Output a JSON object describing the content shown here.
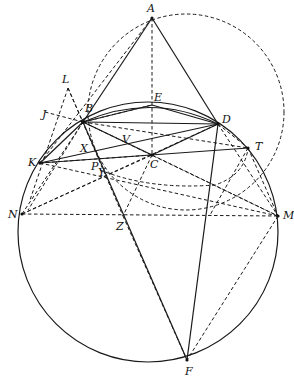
{
  "diagram": {
    "title": "",
    "points": {
      "A": {
        "label": "A",
        "x": 152,
        "y": 18
      },
      "B": {
        "label": "B",
        "x": 83,
        "y": 122
      },
      "E": {
        "label": "E",
        "x": 152,
        "y": 105
      },
      "D": {
        "label": "D",
        "x": 218,
        "y": 124
      },
      "T": {
        "label": "T",
        "x": 248,
        "y": 148
      },
      "C": {
        "label": "C",
        "x": 152,
        "y": 155
      },
      "K": {
        "label": "K",
        "x": 40,
        "y": 163
      },
      "N": {
        "label": "N",
        "x": 22,
        "y": 214
      },
      "M": {
        "label": "M",
        "x": 278,
        "y": 216
      },
      "Z": {
        "label": "Z",
        "x": 123,
        "y": 216
      },
      "F": {
        "label": "F",
        "x": 187,
        "y": 360
      },
      "X": {
        "label": "X",
        "x": 97,
        "y": 152
      },
      "Y": {
        "label": "Y",
        "x": 107,
        "y": 175
      },
      "P": {
        "label": "P",
        "x": 100,
        "y": 170
      },
      "V": {
        "label": "V",
        "x": 128,
        "y": 140
      },
      "L": {
        "label": "L",
        "x": 68,
        "y": 88
      },
      "J": {
        "label": "J",
        "x": 45,
        "y": 112
      }
    },
    "labels": {
      "A": "A",
      "B": "B",
      "E": "E",
      "D": "D",
      "T": "T",
      "C": "C",
      "K": "K",
      "N": "N",
      "M": "M",
      "Z": "Z",
      "F": "F",
      "X": "X",
      "Y": "Y",
      "P": "P",
      "V": "V",
      "L": "L",
      "J": "J"
    },
    "circles": [
      {
        "name": "circumcircle",
        "style": "solid",
        "cx": 148,
        "cy": 232,
        "r": 130
      },
      {
        "name": "dashed-circle",
        "style": "dashed",
        "cx": 186,
        "cy": 112,
        "r": 98
      }
    ],
    "solid_segments": [
      [
        "A",
        "B"
      ],
      [
        "A",
        "D"
      ],
      [
        "B",
        "D"
      ],
      [
        "B",
        "C"
      ],
      [
        "C",
        "D"
      ],
      [
        "K",
        "T"
      ],
      [
        "K",
        "D"
      ],
      [
        "B",
        "F"
      ],
      [
        "D",
        "F"
      ],
      [
        "K",
        "B"
      ]
    ],
    "dashed_segments": [
      [
        "A",
        "E"
      ],
      [
        "E",
        "C"
      ],
      [
        "A",
        "K"
      ],
      [
        "B",
        "T"
      ],
      [
        "N",
        "M"
      ],
      [
        "N",
        "D"
      ],
      [
        "K",
        "M"
      ],
      [
        "B",
        "M"
      ],
      [
        "N",
        "B"
      ],
      [
        "J",
        "B"
      ],
      [
        "L",
        "B"
      ],
      [
        "L",
        "Z"
      ],
      [
        "C",
        "Z"
      ],
      [
        "Z",
        "F"
      ],
      [
        "T",
        "M"
      ],
      [
        "T",
        "F"
      ],
      [
        "K",
        "Y"
      ],
      [
        "D",
        "T"
      ],
      [
        "K",
        "N"
      ]
    ],
    "arcs": [
      {
        "name": "arc-BED",
        "style": "solid",
        "through": [
          "B",
          "E",
          "D"
        ]
      }
    ]
  }
}
